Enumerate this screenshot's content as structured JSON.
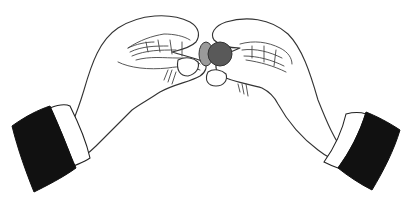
{
  "illustration": {
    "subject": "Two hands holding a coin between thumbs and fingers",
    "style": "black and white line art",
    "colors": {
      "background": "#ffffff",
      "outline": "#333333",
      "sleeve": "#111111",
      "coin_face": "#595959",
      "coin_edge": "#9a9a9a",
      "cuff": "#ffffff"
    },
    "elements": [
      {
        "name": "left-hand",
        "description": "Left hand with curled fingers, thumb pressing the coin"
      },
      {
        "name": "right-hand",
        "description": "Right hand with curled fingers, thumb holding the coin"
      },
      {
        "name": "coin",
        "description": "Dark grey coin with lighter edge, held between hands"
      },
      {
        "name": "left-sleeve",
        "description": "Black jacket sleeve with white shirt cuff, lower left"
      },
      {
        "name": "right-sleeve",
        "description": "Black jacket sleeve with white shirt cuff, lower right"
      }
    ]
  }
}
